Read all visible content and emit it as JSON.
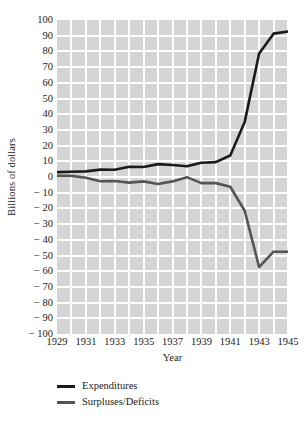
{
  "chart_data": {
    "type": "line",
    "title": "",
    "xlabel": "Year",
    "ylabel": "Billions of dollars",
    "xlim": [
      1929,
      1945
    ],
    "ylim": [
      -100,
      100
    ],
    "grid": true,
    "legend_position": "below-left",
    "x": [
      1929,
      1930,
      1931,
      1932,
      1933,
      1934,
      1935,
      1936,
      1937,
      1938,
      1939,
      1940,
      1941,
      1942,
      1943,
      1944,
      1945
    ],
    "xtick_labels": [
      "1929",
      "1931",
      "1933",
      "1935",
      "1937",
      "1939",
      "1941",
      "1943",
      "1945"
    ],
    "xtick_values": [
      1929,
      1931,
      1933,
      1935,
      1937,
      1939,
      1941,
      1943,
      1945
    ],
    "ytick_labels": [
      "100",
      "90",
      "80",
      "70",
      "60",
      "50",
      "40",
      "30",
      "20",
      "10",
      "0",
      "− 10",
      "− 20",
      "− 30",
      "− 40",
      "− 50",
      "− 60",
      "− 70",
      "− 80",
      "− 90",
      "− 100"
    ],
    "ytick_values": [
      100,
      90,
      80,
      70,
      60,
      50,
      40,
      30,
      20,
      10,
      0,
      -10,
      -20,
      -30,
      -40,
      -50,
      -60,
      -70,
      -80,
      -90,
      -100
    ],
    "series": [
      {
        "name": "Expenditures",
        "color": "#1a1a1a",
        "values": [
          3.1,
          3.3,
          3.6,
          4.7,
          4.6,
          6.5,
          6.4,
          8.2,
          7.6,
          6.8,
          9.1,
          9.5,
          13.7,
          35.1,
          78.6,
          91.3,
          92.7
        ]
      },
      {
        "name": "Surpluses/Deficits",
        "color": "#555555",
        "values": [
          0.7,
          0.7,
          -0.5,
          -2.7,
          -2.6,
          -3.6,
          -2.8,
          -4.4,
          -2.8,
          -0.1,
          -3.9,
          -3.9,
          -6.2,
          -21.5,
          -57.4,
          -47.6,
          -47.6
        ]
      }
    ]
  },
  "legend": {
    "items": [
      {
        "label": "Expenditures",
        "color": "#1a1a1a"
      },
      {
        "label": "Surpluses/Deficits",
        "color": "#555555"
      }
    ]
  },
  "axes": {
    "x_title": "Year",
    "y_title": "Billions of dollars"
  }
}
